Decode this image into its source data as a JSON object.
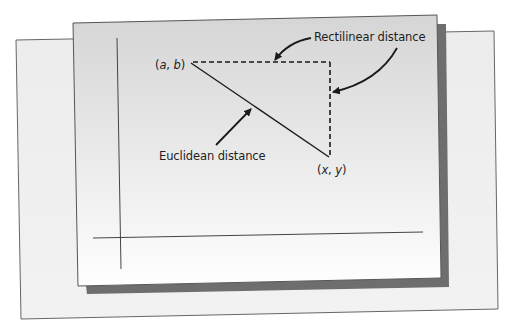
{
  "diagram": {
    "type": "geometry-illustration",
    "points": [
      {
        "label_open": "(",
        "var1": "a",
        "sep": ", ",
        "var2": "b",
        "label_close": ")",
        "x": 191,
        "y": 63
      },
      {
        "label_open": "(",
        "var1": "x",
        "sep": ", ",
        "var2": "y",
        "label_close": ")",
        "x": 329,
        "y": 157
      }
    ],
    "labels": {
      "rectilinear": "Rectilinear distance",
      "euclidean": "Euclidean distance"
    },
    "colors": {
      "back_card": "#efefef",
      "front_card_top": "#d6d6d6",
      "front_card_bottom": "#fdfdfd",
      "shadow": "#6e6e6e",
      "stroke": "#1a1a1a",
      "axis": "#444444",
      "border": "#555555"
    }
  }
}
